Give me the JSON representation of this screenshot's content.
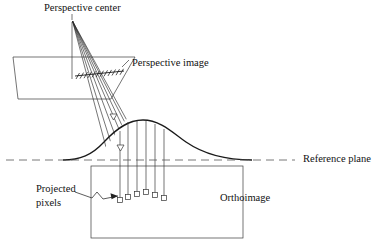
{
  "figure": {
    "labels": {
      "perspective_center": "Perspective center",
      "perspective_image": "Perspective image",
      "reference_plane": "Reference plane",
      "orthoimage": "Orthoimage",
      "projected_pixels_line1": "Projected",
      "projected_pixels_line2": "pixels"
    },
    "colors": {
      "line": "#1a1a1a",
      "ray": "#2b2b2b",
      "dashed": "#555555",
      "background": "#ffffff",
      "text": "#111111"
    },
    "geometry": {
      "perspective_center": {
        "x": 72,
        "y": 20
      },
      "image_plane_parallelogram": [
        {
          "x": 13,
          "y": 57
        },
        {
          "x": 97,
          "y": 57
        },
        {
          "x": 135,
          "y": 57
        },
        {
          "x": 111,
          "y": 98
        },
        {
          "x": 18,
          "y": 98
        }
      ],
      "vertical_axis": {
        "x1": 72,
        "y1": 20,
        "x2": 72,
        "y2": 78
      },
      "pixel_strip": {
        "x1": 76,
        "y1": 75,
        "x2": 122,
        "y2": 71,
        "tick_count": 13
      },
      "ray_count": 7,
      "terrain_curve": "hill profile crossing reference plane",
      "reference_plane_y": 160,
      "orthoimage_rect": {
        "x": 91,
        "y": 166,
        "width": 152,
        "height": 72
      },
      "projected_pixel_squares": [
        {
          "x": 128,
          "y": 197
        },
        {
          "x": 137,
          "y": 194
        },
        {
          "x": 146,
          "y": 192
        },
        {
          "x": 155,
          "y": 195
        },
        {
          "x": 164,
          "y": 198
        }
      ],
      "terrain_triangles": [
        {
          "x": 113,
          "y": 117
        },
        {
          "x": 120,
          "y": 148
        }
      ]
    }
  }
}
